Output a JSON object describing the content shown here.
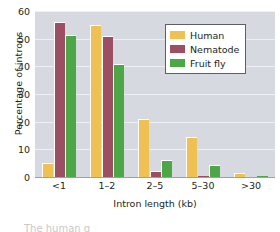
{
  "chart_data": {
    "type": "bar",
    "title": "",
    "xlabel": "Intron length (kb)",
    "ylabel": "Percentage of introns",
    "categories": [
      "<1",
      "1–2",
      "2–5",
      "5–30",
      ">30"
    ],
    "series": [
      {
        "name": "Human",
        "color": "#eec152",
        "values": [
          5.0,
          55.0,
          21.0,
          14.5,
          1.5
        ]
      },
      {
        "name": "Nematode",
        "color": "#9c4f62",
        "values": [
          56.0,
          51.0,
          2.0,
          0.3,
          0.0
        ]
      },
      {
        "name": "Fruit fly",
        "color": "#4da747",
        "values": [
          51.5,
          41.0,
          6.0,
          4.5,
          0.3
        ]
      }
    ],
    "ylim": [
      0,
      60
    ],
    "yticks": [
      0,
      10,
      20,
      30,
      40,
      50,
      60
    ],
    "ytick_labels": [
      "0",
      "10",
      "20",
      "30",
      "40",
      "50",
      "60"
    ],
    "grid": true,
    "grid_axis": "y",
    "legend_position": "upper right",
    "plot_background": "#d7d9e0",
    "gridline_color": "#eef0f4"
  },
  "legend": {
    "entries": [
      {
        "label": "Human"
      },
      {
        "label": "Nematode"
      },
      {
        "label": "Fruit fly"
      }
    ]
  },
  "caption": {
    "remnant": "The human g"
  }
}
